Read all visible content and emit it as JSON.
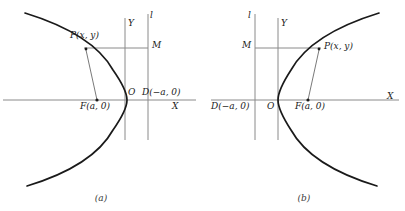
{
  "figures": [
    {
      "id": "figure-a",
      "caption": "(a)",
      "axis_labels": {
        "x": "X",
        "y": "Y",
        "origin": "O",
        "directrix": "l"
      },
      "points": [
        {
          "name": "point-p",
          "label": "P(x, y)"
        },
        {
          "name": "point-m",
          "label": "M"
        },
        {
          "name": "point-f",
          "label": "F(a, 0)"
        },
        {
          "name": "point-d",
          "label": "D(−a, 0)"
        }
      ],
      "curve": "parabola opening left, vertex at origin"
    },
    {
      "id": "figure-b",
      "caption": "(b)",
      "axis_labels": {
        "x": "X",
        "y": "Y",
        "origin": "O",
        "directrix": "l"
      },
      "points": [
        {
          "name": "point-p",
          "label": "P(x, y)"
        },
        {
          "name": "point-m",
          "label": "M"
        },
        {
          "name": "point-f",
          "label": "F(a, 0)"
        },
        {
          "name": "point-d",
          "label": "D(−a, 0)"
        }
      ],
      "curve": "parabola opening right, vertex at origin"
    }
  ],
  "colors": {
    "curve": "#1a1a1a",
    "axis": "#8a8a8a",
    "connector": "#6a6a6a",
    "text": "#1a1a1a",
    "background": "#ffffff"
  }
}
